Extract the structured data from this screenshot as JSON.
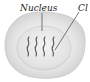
{
  "diagram": {
    "labels": {
      "nucleus": "Nucleus",
      "chromosome": "Cl"
    },
    "colors": {
      "cell_outer": "#d9d9d9",
      "cell_inner": "#f2f2f2",
      "nucleus": "#e6e6e6",
      "strands": "#555555",
      "leader_line": "#444444"
    },
    "chromosome_count": 4
  }
}
